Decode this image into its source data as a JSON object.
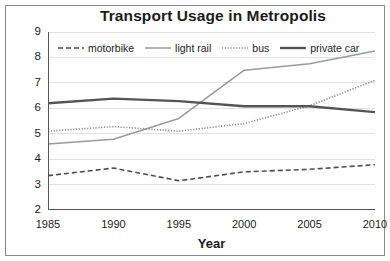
{
  "chart_data": {
    "type": "line",
    "title": "Transport Usage in Metropolis",
    "xlabel": "Year",
    "ylabel": "Millions of trips",
    "x": [
      1985,
      1990,
      1995,
      2000,
      2005,
      2010
    ],
    "xticklabels": [
      "1985",
      "1990",
      "1995",
      "2000",
      "2005",
      "2010"
    ],
    "yticklabels": [
      "2",
      "3",
      "4",
      "5",
      "6",
      "7",
      "8",
      "9"
    ],
    "ylim": [
      2,
      9
    ],
    "xlim": [
      1985,
      2010
    ],
    "grid": "horizontal",
    "legend_position": "top-left-inside",
    "series": [
      {
        "name": "motorbike",
        "style": "dashed",
        "color": "#4d4d4d",
        "width": 1.6,
        "values": [
          3.35,
          3.65,
          3.15,
          3.5,
          3.6,
          3.78
        ]
      },
      {
        "name": "light rail",
        "style": "solid",
        "color": "#9a9a9a",
        "width": 1.5,
        "values": [
          4.6,
          4.78,
          5.6,
          7.5,
          7.75,
          8.25
        ]
      },
      {
        "name": "bus",
        "style": "dotted",
        "color": "#8c8c8c",
        "width": 1.6,
        "values": [
          5.1,
          5.28,
          5.1,
          5.4,
          6.1,
          7.1
        ]
      },
      {
        "name": "private car",
        "style": "solid-thick",
        "color": "#555555",
        "width": 2.4,
        "values": [
          6.2,
          6.38,
          6.28,
          6.08,
          6.08,
          5.85
        ]
      }
    ]
  },
  "legend": {
    "items": [
      {
        "label": "motorbike"
      },
      {
        "label": "light rail"
      },
      {
        "label": "bus"
      },
      {
        "label": "private car"
      }
    ]
  }
}
